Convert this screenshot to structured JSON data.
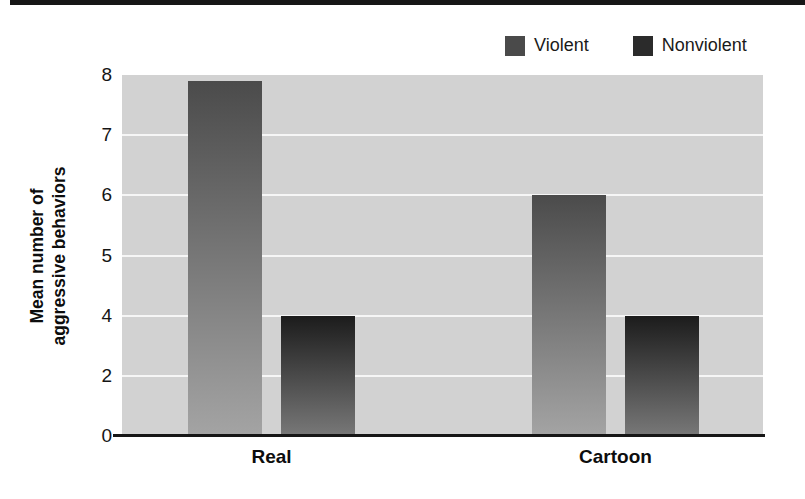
{
  "page": {
    "background_color": "#ffffff",
    "top_rule_color": "#161616"
  },
  "legend": {
    "items": [
      {
        "label": "Violent",
        "color": "#4a4a4a"
      },
      {
        "label": "Nonviolent",
        "color": "#2b2b2b"
      }
    ]
  },
  "y_axis": {
    "title_line1": "Mean number of",
    "title_line2": "aggressive behaviors"
  },
  "chart_data": {
    "type": "bar",
    "title": "",
    "categories": [
      "Real",
      "Cartoon"
    ],
    "series": [
      {
        "name": "Violent",
        "values": [
          7.9,
          6
        ]
      },
      {
        "name": "Nonviolent",
        "values": [
          4,
          4
        ]
      }
    ],
    "xlabel": "",
    "ylabel": "Mean number of aggressive behaviors",
    "ylim": [
      0,
      8
    ],
    "y_ticks": [
      8,
      7,
      6,
      5,
      4,
      2,
      0
    ],
    "axis_note": "y-axis tick values are printed at equal pixel spacing (non-linear distorted axis as in source figure)",
    "grid": true,
    "gridline_ticks": [
      7,
      6,
      5,
      4,
      2
    ],
    "legend_position": "top-right",
    "colors": {
      "plot_background": "#d2d2d2",
      "gridline": "#f8f8f8",
      "axis_line": "#161616",
      "violent_bar_top": "#4b4b4b",
      "violent_bar_bottom": "#a4a4a4",
      "nonviolent_bar_top": "#1c1c1c",
      "nonviolent_bar_bottom": "#787878"
    }
  }
}
